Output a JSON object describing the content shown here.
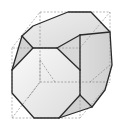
{
  "figure": {
    "colors": {
      "edge": "#2a2a2a",
      "hidden_edge": "#8a8a8a",
      "cube_wire": "#9a9a9a",
      "face_light": "#f4f4f4",
      "face_mid": "#e2e2e2",
      "face_dark": "#cfcfcf",
      "background": "#ffffff"
    },
    "outline": [
      [
        68,
        12
      ],
      [
        91,
        12
      ],
      [
        110,
        32
      ],
      [
        112,
        65
      ],
      [
        105,
        90
      ],
      [
        92,
        107
      ],
      [
        59,
        118
      ],
      [
        34,
        118
      ],
      [
        12,
        93
      ],
      [
        12,
        70
      ],
      [
        22,
        36
      ],
      [
        33,
        26
      ]
    ],
    "faces": [
      {
        "name": "top-face",
        "points": [
          [
            33,
            26
          ],
          [
            68,
            12
          ],
          [
            91,
            12
          ],
          [
            110,
            32
          ],
          [
            80,
            35
          ],
          [
            57,
            48
          ],
          [
            33,
            48
          ],
          [
            22,
            36
          ]
        ],
        "fill": "#e9e9e9"
      },
      {
        "name": "front-octagon",
        "points": [
          [
            33,
            48
          ],
          [
            57,
            48
          ],
          [
            80,
            70
          ],
          [
            80,
            95
          ],
          [
            59,
            118
          ],
          [
            34,
            118
          ],
          [
            12,
            93
          ],
          [
            12,
            70
          ]
        ],
        "fill": "#f1f1f1"
      },
      {
        "name": "right-face",
        "points": [
          [
            80,
            35
          ],
          [
            110,
            32
          ],
          [
            112,
            65
          ],
          [
            105,
            90
          ],
          [
            92,
            107
          ],
          [
            80,
            95
          ],
          [
            80,
            70
          ],
          [
            57,
            48
          ]
        ],
        "fill": "#dedede"
      },
      {
        "name": "upper-left-triangle",
        "points": [
          [
            22,
            36
          ],
          [
            33,
            48
          ],
          [
            12,
            70
          ]
        ],
        "fill": "#d4d4d4"
      },
      {
        "name": "top-right-triangle",
        "points": [
          [
            57,
            48
          ],
          [
            80,
            35
          ],
          [
            80,
            70
          ]
        ],
        "fill": "#d9d9d9"
      },
      {
        "name": "bottom-right-triangle",
        "points": [
          [
            80,
            95
          ],
          [
            92,
            107
          ],
          [
            59,
            118
          ]
        ],
        "fill": "#d2d2d2"
      }
    ],
    "cube_wireframe": {
      "front": [
        [
          12,
          48
        ],
        [
          80,
          48
        ],
        [
          80,
          118
        ],
        [
          12,
          118
        ]
      ],
      "back": [
        [
          40,
          12
        ],
        [
          110,
          12
        ],
        [
          110,
          82
        ],
        [
          40,
          82
        ]
      ]
    }
  }
}
